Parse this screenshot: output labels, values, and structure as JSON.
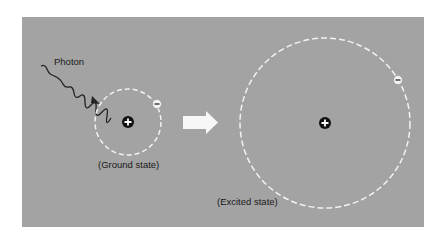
{
  "diagram": {
    "photon_label": "Photon",
    "ground_label": "(Ground state)",
    "excited_label": "(Excited state)",
    "nucleus_symbol": "+",
    "electron_symbol": "−",
    "colors": {
      "background": "#a3a3a3",
      "orbit": "#f2f2f2",
      "nucleus": "#111111",
      "electron": "#f4f4f4",
      "arrow": "#f7f7f7",
      "photon": "#222222"
    }
  }
}
